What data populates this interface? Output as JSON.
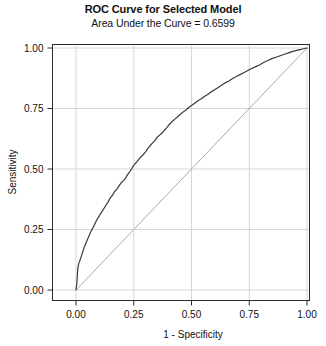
{
  "chart_data": {
    "type": "line",
    "title": "ROC Curve for Selected Model",
    "subtitle": "Area Under the Curve = 0.6599",
    "auc": 0.6599,
    "xlabel": "1 - Specificity",
    "ylabel": "Sensitivity",
    "xlim": [
      0.0,
      1.0
    ],
    "ylim": [
      0.0,
      1.0
    ],
    "xticks": [
      "0.00",
      "0.25",
      "0.50",
      "0.75",
      "1.00"
    ],
    "yticks": [
      "0.00",
      "0.25",
      "0.50",
      "0.75",
      "1.00"
    ],
    "xtick_values": [
      0.0,
      0.25,
      0.5,
      0.75,
      1.0
    ],
    "ytick_values": [
      0.0,
      0.25,
      0.5,
      0.75,
      1.0
    ],
    "grid": true,
    "legend": "none",
    "series": [
      {
        "name": "ROC curve",
        "color": "#3a3a3a",
        "points": [
          [
            0.0,
            0.0
          ],
          [
            0.004,
            0.03
          ],
          [
            0.006,
            0.065
          ],
          [
            0.008,
            0.09
          ],
          [
            0.012,
            0.11
          ],
          [
            0.018,
            0.125
          ],
          [
            0.024,
            0.142
          ],
          [
            0.03,
            0.16
          ],
          [
            0.036,
            0.178
          ],
          [
            0.044,
            0.196
          ],
          [
            0.052,
            0.214
          ],
          [
            0.06,
            0.232
          ],
          [
            0.068,
            0.248
          ],
          [
            0.078,
            0.266
          ],
          [
            0.088,
            0.286
          ],
          [
            0.098,
            0.302
          ],
          [
            0.108,
            0.318
          ],
          [
            0.118,
            0.332
          ],
          [
            0.128,
            0.348
          ],
          [
            0.138,
            0.362
          ],
          [
            0.148,
            0.38
          ],
          [
            0.158,
            0.392
          ],
          [
            0.168,
            0.408
          ],
          [
            0.178,
            0.418
          ],
          [
            0.186,
            0.43
          ],
          [
            0.196,
            0.444
          ],
          [
            0.206,
            0.452
          ],
          [
            0.214,
            0.462
          ],
          [
            0.224,
            0.478
          ],
          [
            0.234,
            0.49
          ],
          [
            0.244,
            0.506
          ],
          [
            0.252,
            0.518
          ],
          [
            0.262,
            0.528
          ],
          [
            0.272,
            0.54
          ],
          [
            0.282,
            0.552
          ],
          [
            0.292,
            0.56
          ],
          [
            0.302,
            0.572
          ],
          [
            0.312,
            0.586
          ],
          [
            0.322,
            0.598
          ],
          [
            0.332,
            0.608
          ],
          [
            0.342,
            0.618
          ],
          [
            0.352,
            0.632
          ],
          [
            0.362,
            0.64
          ],
          [
            0.372,
            0.648
          ],
          [
            0.382,
            0.66
          ],
          [
            0.392,
            0.67
          ],
          [
            0.404,
            0.684
          ],
          [
            0.416,
            0.696
          ],
          [
            0.428,
            0.706
          ],
          [
            0.44,
            0.716
          ],
          [
            0.452,
            0.726
          ],
          [
            0.464,
            0.736
          ],
          [
            0.476,
            0.744
          ],
          [
            0.488,
            0.754
          ],
          [
            0.5,
            0.762
          ],
          [
            0.514,
            0.772
          ],
          [
            0.528,
            0.782
          ],
          [
            0.542,
            0.79
          ],
          [
            0.556,
            0.8
          ],
          [
            0.57,
            0.808
          ],
          [
            0.584,
            0.818
          ],
          [
            0.598,
            0.826
          ],
          [
            0.614,
            0.836
          ],
          [
            0.63,
            0.846
          ],
          [
            0.646,
            0.856
          ],
          [
            0.662,
            0.864
          ],
          [
            0.678,
            0.874
          ],
          [
            0.694,
            0.882
          ],
          [
            0.71,
            0.89
          ],
          [
            0.726,
            0.898
          ],
          [
            0.742,
            0.906
          ],
          [
            0.758,
            0.914
          ],
          [
            0.776,
            0.922
          ],
          [
            0.794,
            0.93
          ],
          [
            0.812,
            0.94
          ],
          [
            0.83,
            0.948
          ],
          [
            0.848,
            0.956
          ],
          [
            0.866,
            0.962
          ],
          [
            0.884,
            0.968
          ],
          [
            0.902,
            0.974
          ],
          [
            0.92,
            0.98
          ],
          [
            0.938,
            0.986
          ],
          [
            0.956,
            0.99
          ],
          [
            0.974,
            0.994
          ],
          [
            0.988,
            0.998
          ],
          [
            1.0,
            1.0
          ]
        ]
      },
      {
        "name": "reference diagonal",
        "color": "#aaaaaa",
        "points": [
          [
            0.0,
            0.0
          ],
          [
            1.0,
            1.0
          ]
        ]
      }
    ]
  }
}
